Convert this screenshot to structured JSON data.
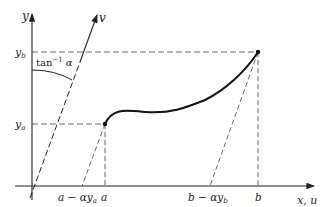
{
  "diagram": {
    "axes": {
      "y_label": "y",
      "v_label": "v",
      "x_label": "x, u"
    },
    "levels": {
      "y_b": "y",
      "y_b_sub": "b",
      "y_a": "y",
      "y_a_sub": "a"
    },
    "angle_label": {
      "fn": "tan",
      "sup": "−1",
      "arg": "α"
    },
    "ticks": {
      "a_shift": "a − αy",
      "a_shift_sub": "a",
      "a": "a",
      "b_shift": "b − αy",
      "b_shift_sub": "b",
      "b": "b"
    },
    "colors": {
      "ink": "#222222",
      "dash": "#555555",
      "background": "#ffffff"
    }
  }
}
